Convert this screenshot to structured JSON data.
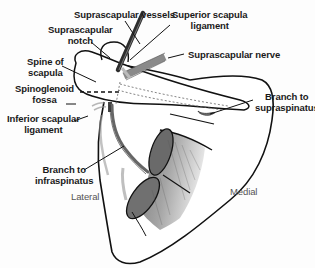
{
  "figure": {
    "labels": {
      "suprascapular_vessels": "Suprascapular vessels",
      "superior_scapula_ligament_line1": "Superior scapula",
      "superior_scapula_ligament_line2": "ligament",
      "suprascapular_notch_line1": "Suprascapular",
      "suprascapular_notch_line2": "notch",
      "suprascapular_nerve": "Suprascapular nerve",
      "spine_of_scapula_line1": "Spine of",
      "spine_of_scapula_line2": "scapula",
      "spinoglenoid_fossa_line1": "Spinoglenoid",
      "spinoglenoid_fossa_line2": "fossa",
      "branch_to_supraspinatus_line1": "Branch to",
      "branch_to_supraspinatus_line2": "supraspinatus",
      "inferior_scapular_ligament_line1": "Inferior scapular",
      "inferior_scapular_ligament_line2": "ligament",
      "branch_to_infraspinatus_line1": "Branch to",
      "branch_to_infraspinatus_line2": "infraspinatus",
      "lateral": "Lateral",
      "medial": "Medial"
    },
    "colors": {
      "outline": "#111111",
      "nerve": "#7a7a7a",
      "vessels": "#3a3a3a",
      "muscle_shade": "#8c8c8c",
      "label_text": "#1a1a1a",
      "orientation_text": "#555555"
    }
  }
}
